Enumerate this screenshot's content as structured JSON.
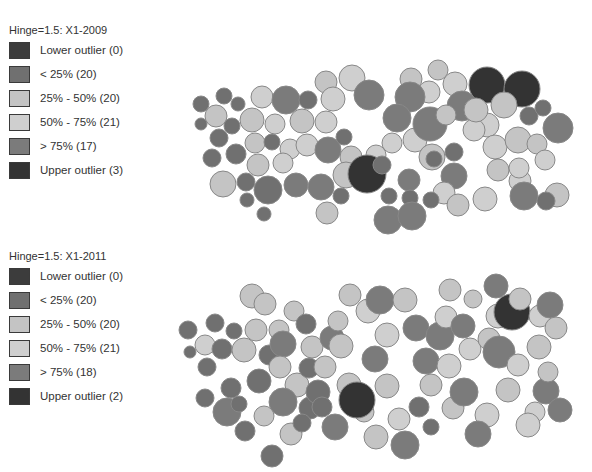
{
  "colors": {
    "lower_outlier": "#3c3c3c",
    "lt25": "#707070",
    "p25_50": "#c4c4c4",
    "p50_75": "#cfcfcf",
    "gt75": "#7b7b7b",
    "upper_outlier": "#333333"
  },
  "maps": [
    {
      "title": "Hinge=1.5: X1-2009",
      "legend": [
        {
          "key": "lower_outlier",
          "label": "Lower outlier (0)"
        },
        {
          "key": "lt25",
          "label": "< 25% (20)"
        },
        {
          "key": "p25_50",
          "label": "25% - 50% (20)"
        },
        {
          "key": "p50_75",
          "label": "50% - 75% (21)"
        },
        {
          "key": "gt75",
          "label": "> 75% (17)"
        },
        {
          "key": "upper_outlier",
          "label": "Upper outlier (3)"
        }
      ]
    },
    {
      "title": "Hinge=1.5: X1-2011",
      "legend": [
        {
          "key": "lower_outlier",
          "label": "Lower outlier (0)"
        },
        {
          "key": "lt25",
          "label": "< 25% (20)"
        },
        {
          "key": "p25_50",
          "label": "25% - 50% (20)"
        },
        {
          "key": "p50_75",
          "label": "50% - 75% (21)"
        },
        {
          "key": "gt75",
          "label": "> 75% (18)"
        },
        {
          "key": "upper_outlier",
          "label": "Upper outlier (2)"
        }
      ]
    }
  ],
  "chart_data": [
    {
      "type": "box-map-cartogram",
      "title": "Hinge=1.5: X1-2009",
      "legend": [
        "Lower outlier (0)",
        "< 25% (20)",
        "25% - 50% (20)",
        "50% - 75% (21)",
        "> 75% (17)",
        "Upper outlier (3)"
      ],
      "category_counts": {
        "lower_outlier": 0,
        "lt25": 20,
        "p25_50": 20,
        "p50_75": 21,
        "gt75": 17,
        "upper_outlier": 3
      },
      "circles": [
        [
          201,
          104,
          8,
          "lt25"
        ],
        [
          224,
          96,
          8,
          "lt25"
        ],
        [
          238,
          104,
          7,
          "lt25"
        ],
        [
          216,
          116,
          11,
          "p25_50"
        ],
        [
          201,
          124,
          6,
          "lt25"
        ],
        [
          232,
          126,
          8,
          "lt25"
        ],
        [
          219,
          138,
          9,
          "lt25"
        ],
        [
          262,
          97,
          11,
          "p50_75"
        ],
        [
          252,
          120,
          12,
          "p25_50"
        ],
        [
          275,
          124,
          10,
          "p50_75"
        ],
        [
          255,
          143,
          10,
          "p25_50"
        ],
        [
          272,
          142,
          8,
          "lt25"
        ],
        [
          290,
          149,
          10,
          "p50_75"
        ],
        [
          212,
          158,
          9,
          "lt25"
        ],
        [
          236,
          154,
          10,
          "lt25"
        ],
        [
          258,
          165,
          11,
          "p25_50"
        ],
        [
          283,
          163,
          10,
          "p50_75"
        ],
        [
          223,
          184,
          13,
          "p25_50"
        ],
        [
          246,
          182,
          9,
          "lt25"
        ],
        [
          268,
          190,
          14,
          "lt25"
        ],
        [
          247,
          200,
          7,
          "lt25"
        ],
        [
          264,
          214,
          7,
          "lt25"
        ],
        [
          286,
          100,
          14,
          "gt75"
        ],
        [
          308,
          100,
          9,
          "lt25"
        ],
        [
          302,
          121,
          12,
          "p25_50"
        ],
        [
          326,
          122,
          11,
          "p50_75"
        ],
        [
          307,
          145,
          11,
          "p50_75"
        ],
        [
          328,
          150,
          13,
          "gt75"
        ],
        [
          296,
          185,
          12,
          "gt75"
        ],
        [
          321,
          187,
          13,
          "gt75"
        ],
        [
          326,
          82,
          11,
          "p25_50"
        ],
        [
          352,
          78,
          13,
          "p50_75"
        ],
        [
          333,
          99,
          12,
          "p50_75"
        ],
        [
          344,
          137,
          8,
          "lt25"
        ],
        [
          369,
          95,
          15,
          "gt75"
        ],
        [
          351,
          157,
          11,
          "p25_50"
        ],
        [
          376,
          155,
          10,
          "p50_75"
        ],
        [
          346,
          175,
          13,
          "p25_50"
        ],
        [
          367,
          174,
          19,
          "upper_outlier"
        ],
        [
          382,
          165,
          9,
          "lt25"
        ],
        [
          327,
          213,
          11,
          "p25_50"
        ],
        [
          341,
          196,
          8,
          "lt25"
        ],
        [
          389,
          196,
          8,
          "lt25"
        ],
        [
          388,
          220,
          14,
          "gt75"
        ],
        [
          411,
          79,
          11,
          "p25_50"
        ],
        [
          429,
          92,
          11,
          "p50_75"
        ],
        [
          410,
          97,
          15,
          "gt75"
        ],
        [
          397,
          118,
          14,
          "gt75"
        ],
        [
          392,
          143,
          10,
          "p50_75"
        ],
        [
          415,
          140,
          12,
          "p50_75"
        ],
        [
          409,
          180,
          11,
          "gt75"
        ],
        [
          410,
          198,
          8,
          "lt25"
        ],
        [
          412,
          216,
          14,
          "gt75"
        ],
        [
          438,
          70,
          10,
          "p25_50"
        ],
        [
          455,
          84,
          12,
          "p50_75"
        ],
        [
          462,
          106,
          15,
          "gt75"
        ],
        [
          430,
          124,
          17,
          "gt75"
        ],
        [
          446,
          115,
          10,
          "p25_50"
        ],
        [
          432,
          157,
          13,
          "p25_50"
        ],
        [
          434,
          159,
          8,
          "lt25"
        ],
        [
          454,
          152,
          9,
          "lt25"
        ],
        [
          454,
          176,
          13,
          "gt75"
        ],
        [
          444,
          193,
          11,
          "p50_75"
        ],
        [
          431,
          200,
          8,
          "lt25"
        ],
        [
          458,
          205,
          11,
          "p25_50"
        ],
        [
          487,
          85,
          18,
          "upper_outlier"
        ],
        [
          522,
          89,
          18,
          "upper_outlier"
        ],
        [
          487,
          125,
          12,
          "p50_75"
        ],
        [
          504,
          105,
          13,
          "p25_50"
        ],
        [
          529,
          116,
          9,
          "lt25"
        ],
        [
          543,
          108,
          8,
          "lt25"
        ],
        [
          474,
          130,
          11,
          "p50_75"
        ],
        [
          495,
          147,
          12,
          "p50_75"
        ],
        [
          518,
          140,
          13,
          "p25_50"
        ],
        [
          537,
          144,
          10,
          "p25_50"
        ],
        [
          558,
          128,
          15,
          "gt75"
        ],
        [
          498,
          170,
          11,
          "p25_50"
        ],
        [
          485,
          199,
          12,
          "p50_75"
        ],
        [
          520,
          181,
          11,
          "p50_75"
        ],
        [
          524,
          196,
          14,
          "gt75"
        ],
        [
          545,
          160,
          10,
          "p50_75"
        ],
        [
          557,
          195,
          12,
          "p25_50"
        ],
        [
          546,
          201,
          9,
          "lt25"
        ],
        [
          476,
          110,
          12,
          "p25_50"
        ],
        [
          519,
          168,
          10,
          "p50_75"
        ]
      ]
    },
    {
      "type": "box-map-cartogram",
      "title": "Hinge=1.5: X1-2011",
      "legend": [
        "Lower outlier (0)",
        "< 25% (20)",
        "25% - 50% (20)",
        "50% - 75% (21)",
        "> 75% (18)",
        "Upper outlier (2)"
      ],
      "category_counts": {
        "lower_outlier": 0,
        "lt25": 20,
        "p25_50": 20,
        "p50_75": 21,
        "gt75": 18,
        "upper_outlier": 2
      },
      "circles": [
        [
          188,
          330,
          9,
          "lt25"
        ],
        [
          215,
          323,
          9,
          "lt25"
        ],
        [
          234,
          331,
          8,
          "lt25"
        ],
        [
          205,
          345,
          10,
          "p50_75"
        ],
        [
          190,
          352,
          6,
          "lt25"
        ],
        [
          222,
          349,
          10,
          "lt25"
        ],
        [
          207,
          367,
          9,
          "lt25"
        ],
        [
          205,
          398,
          9,
          "lt25"
        ],
        [
          227,
          412,
          14,
          "gt75"
        ],
        [
          239,
          404,
          8,
          "lt25"
        ],
        [
          245,
          431,
          10,
          "lt25"
        ],
        [
          256,
          330,
          11,
          "p25_50"
        ],
        [
          244,
          350,
          12,
          "p25_50"
        ],
        [
          259,
          381,
          12,
          "lt25"
        ],
        [
          231,
          388,
          10,
          "lt25"
        ],
        [
          252,
          296,
          12,
          "p25_50"
        ],
        [
          265,
          304,
          11,
          "p25_50"
        ],
        [
          279,
          330,
          10,
          "p25_50"
        ],
        [
          294,
          311,
          10,
          "p25_50"
        ],
        [
          269,
          355,
          10,
          "lt25"
        ],
        [
          283,
          344,
          13,
          "gt75"
        ],
        [
          280,
          367,
          11,
          "p25_50"
        ],
        [
          297,
          385,
          12,
          "p25_50"
        ],
        [
          283,
          402,
          14,
          "gt75"
        ],
        [
          310,
          408,
          11,
          "lt25"
        ],
        [
          264,
          416,
          10,
          "p25_50"
        ],
        [
          272,
          456,
          11,
          "lt25"
        ],
        [
          291,
          434,
          11,
          "p25_50"
        ],
        [
          306,
          324,
          10,
          "lt25"
        ],
        [
          312,
          347,
          11,
          "p25_50"
        ],
        [
          332,
          338,
          12,
          "gt75"
        ],
        [
          338,
          321,
          10,
          "p25_50"
        ],
        [
          309,
          368,
          10,
          "lt25"
        ],
        [
          325,
          367,
          11,
          "p25_50"
        ],
        [
          318,
          392,
          12,
          "lt25"
        ],
        [
          302,
          423,
          9,
          "lt25"
        ],
        [
          322,
          407,
          10,
          "lt25"
        ],
        [
          335,
          427,
          13,
          "gt75"
        ],
        [
          341,
          346,
          12,
          "p25_50"
        ],
        [
          350,
          295,
          11,
          "p25_50"
        ],
        [
          368,
          311,
          12,
          "p50_75"
        ],
        [
          380,
          300,
          14,
          "gt75"
        ],
        [
          405,
          300,
          12,
          "p25_50"
        ],
        [
          387,
          335,
          12,
          "p50_75"
        ],
        [
          416,
          328,
          13,
          "gt75"
        ],
        [
          375,
          359,
          13,
          "gt75"
        ],
        [
          349,
          385,
          12,
          "p25_50"
        ],
        [
          364,
          412,
          10,
          "p25_50"
        ],
        [
          357,
          400,
          18,
          "upper_outlier"
        ],
        [
          387,
          386,
          12,
          "p25_50"
        ],
        [
          376,
          437,
          12,
          "p25_50"
        ],
        [
          399,
          419,
          11,
          "p50_75"
        ],
        [
          405,
          445,
          14,
          "gt75"
        ],
        [
          419,
          407,
          10,
          "lt25"
        ],
        [
          431,
          385,
          11,
          "p25_50"
        ],
        [
          426,
          361,
          13,
          "gt75"
        ],
        [
          440,
          336,
          14,
          "gt75"
        ],
        [
          446,
          317,
          11,
          "p50_75"
        ],
        [
          450,
          290,
          11,
          "p25_50"
        ],
        [
          449,
          366,
          12,
          "p50_75"
        ],
        [
          453,
          408,
          11,
          "p25_50"
        ],
        [
          431,
          427,
          8,
          "lt25"
        ],
        [
          463,
          326,
          12,
          "gt75"
        ],
        [
          470,
          349,
          11,
          "p50_75"
        ],
        [
          464,
          392,
          14,
          "gt75"
        ],
        [
          473,
          299,
          9,
          "p25_50"
        ],
        [
          496,
          286,
          12,
          "gt75"
        ],
        [
          498,
          316,
          12,
          "p50_75"
        ],
        [
          489,
          339,
          11,
          "p25_50"
        ],
        [
          499,
          352,
          16,
          "gt75"
        ],
        [
          512,
          312,
          18,
          "upper_outlier"
        ],
        [
          508,
          390,
          12,
          "p25_50"
        ],
        [
          487,
          415,
          12,
          "p50_75"
        ],
        [
          478,
          434,
          13,
          "gt75"
        ],
        [
          518,
          365,
          11,
          "p50_75"
        ],
        [
          520,
          299,
          11,
          "p25_50"
        ],
        [
          540,
          316,
          11,
          "p50_75"
        ],
        [
          539,
          347,
          12,
          "p25_50"
        ],
        [
          546,
          391,
          13,
          "gt75"
        ],
        [
          535,
          412,
          10,
          "p50_75"
        ],
        [
          550,
          305,
          13,
          "gt75"
        ],
        [
          556,
          328,
          11,
          "p25_50"
        ],
        [
          548,
          372,
          10,
          "p25_50"
        ],
        [
          528,
          425,
          12,
          "p50_75"
        ],
        [
          560,
          410,
          12,
          "gt75"
        ]
      ]
    }
  ]
}
